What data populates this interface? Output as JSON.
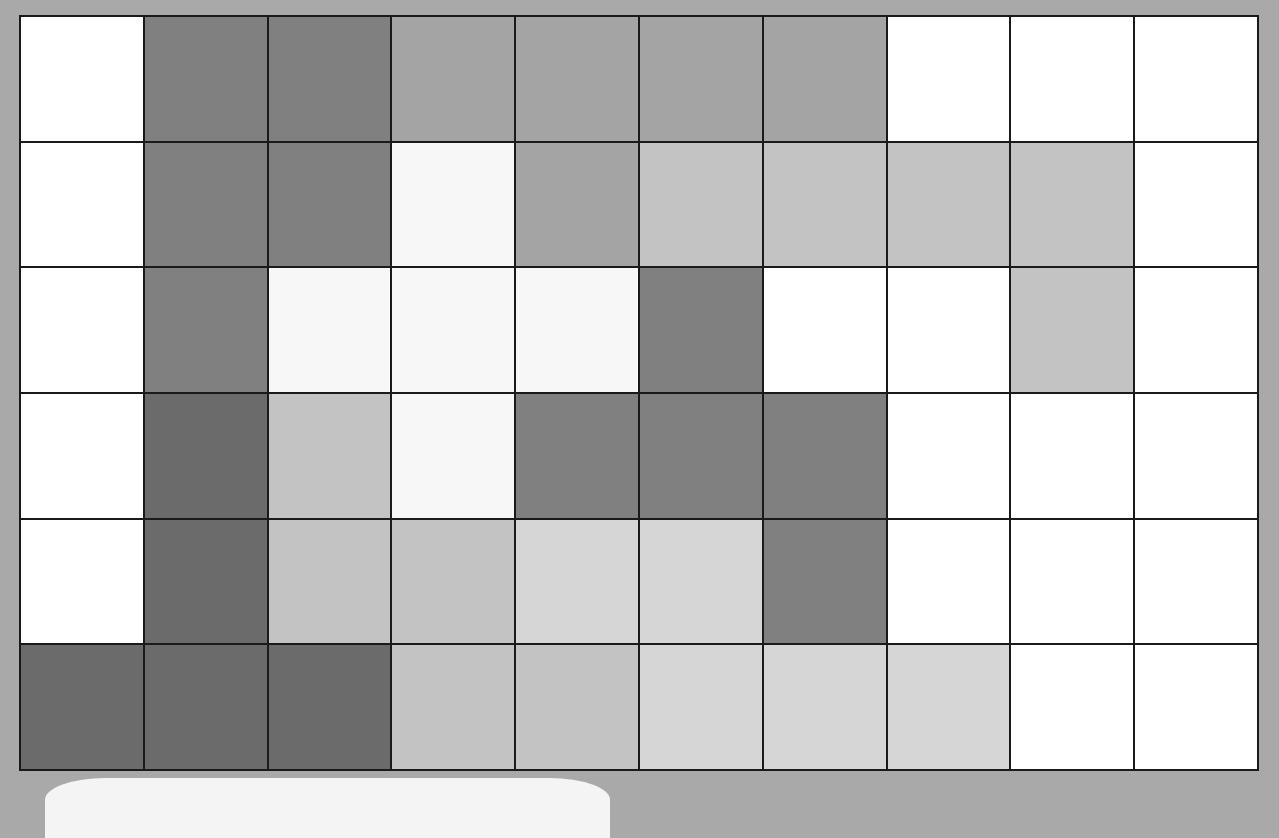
{
  "board": {
    "rows": 6,
    "cols": 10,
    "palette": {
      "white": "#ffffff",
      "nearwhite": "#f7f7f7",
      "lighter": "#d6d6d6",
      "light": "#c3c3c3",
      "mid": "#a4a4a4",
      "dark": "#808080",
      "darker": "#6b6b6b"
    },
    "cells": [
      [
        "white",
        "dark",
        "dark",
        "mid",
        "mid",
        "mid",
        "mid",
        "white",
        "white",
        "white"
      ],
      [
        "white",
        "dark",
        "dark",
        "nearwhite",
        "mid",
        "light",
        "light",
        "light",
        "light",
        "white"
      ],
      [
        "white",
        "dark",
        "nearwhite",
        "nearwhite",
        "nearwhite",
        "dark",
        "white",
        "white",
        "light",
        "white"
      ],
      [
        "white",
        "darker",
        "light",
        "nearwhite",
        "dark",
        "dark",
        "dark",
        "white",
        "white",
        "white"
      ],
      [
        "white",
        "darker",
        "light",
        "light",
        "lighter",
        "lighter",
        "dark",
        "white",
        "white",
        "white"
      ],
      [
        "darker",
        "darker",
        "darker",
        "light",
        "light",
        "lighter",
        "lighter",
        "lighter",
        "white",
        "white"
      ]
    ]
  },
  "colors": {
    "background": "#a9a9a9",
    "grid_line": "#1a1a1a",
    "panel": "#f4f4f4"
  }
}
